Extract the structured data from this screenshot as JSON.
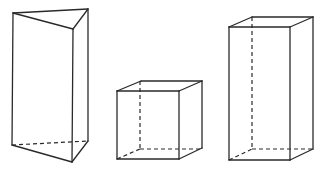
{
  "figure": {
    "stroke_color": "#2a2a2a",
    "background": "#ffffff",
    "shapes": [
      {
        "name": "triangular-prism",
        "visible_edges": [
          [
            13,
            13,
            88,
            9
          ],
          [
            13,
            13,
            73,
            29
          ],
          [
            73,
            29,
            88,
            9
          ],
          [
            13,
            13,
            12,
            145
          ],
          [
            73,
            29,
            72,
            162
          ],
          [
            88,
            9,
            88,
            141
          ],
          [
            12,
            145,
            72,
            162
          ],
          [
            72,
            162,
            88,
            141
          ]
        ],
        "hidden_edges": [
          [
            12,
            145,
            88,
            141
          ]
        ]
      },
      {
        "name": "cube",
        "visible_edges": [
          [
            117,
            91,
            179,
            91
          ],
          [
            179,
            91,
            179,
            159
          ],
          [
            179,
            159,
            117,
            159
          ],
          [
            117,
            159,
            117,
            91
          ],
          [
            117,
            91,
            141,
            81
          ],
          [
            141,
            81,
            202,
            81
          ],
          [
            179,
            91,
            202,
            81
          ],
          [
            202,
            81,
            202,
            148
          ],
          [
            179,
            159,
            202,
            148
          ]
        ],
        "hidden_edges": [
          [
            140,
            81,
            140,
            149
          ],
          [
            140,
            149,
            202,
            149
          ],
          [
            117,
            159,
            140,
            149
          ]
        ]
      },
      {
        "name": "rectangular-prism",
        "visible_edges": [
          [
            229,
            27,
            290,
            27
          ],
          [
            290,
            27,
            290,
            160
          ],
          [
            290,
            160,
            229,
            160
          ],
          [
            229,
            160,
            229,
            27
          ],
          [
            229,
            27,
            252,
            17
          ],
          [
            252,
            17,
            313,
            17
          ],
          [
            290,
            27,
            313,
            17
          ],
          [
            313,
            17,
            313,
            149
          ],
          [
            290,
            160,
            313,
            149
          ]
        ],
        "hidden_edges": [
          [
            252,
            17,
            252,
            149
          ],
          [
            252,
            149,
            313,
            149
          ],
          [
            229,
            160,
            252,
            149
          ]
        ]
      }
    ]
  }
}
